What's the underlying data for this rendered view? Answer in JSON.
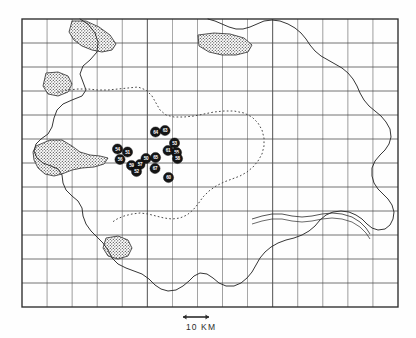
{
  "figure": {
    "type": "archaeological-distribution-map",
    "background_color": "#fefefe",
    "ink_color": "#2b2b2b"
  },
  "frame": {
    "left": 22,
    "top": 19,
    "right": 398,
    "bottom": 307,
    "grid_columns": 15,
    "grid_rows": 12,
    "cell_width": 25.07,
    "cell_height": 24.0,
    "grid_color": "#4a4a4a",
    "border_color": "#2b2b2b"
  },
  "scale_bar": {
    "label": "10 KM",
    "length_px": 26,
    "x": 196,
    "y": 317,
    "label_x": 186,
    "label_y": 322,
    "arrow_style": "double-headed"
  },
  "legend_features": {
    "coastline": "solid irregular outline",
    "internal_boundary": "dotted line",
    "stippled_area": "cross-hatched / stippled polygon",
    "river": "thin double line"
  },
  "markers": {
    "shape": "filled-circle",
    "fill_color": "#151515",
    "text_color": "#ffffff",
    "radius": 5.1,
    "count": 16,
    "items": [
      {
        "id": "site-64",
        "label": "64",
        "x": 155.5,
        "y": 132.0
      },
      {
        "id": "site-63",
        "label": "63",
        "x": 165.0,
        "y": 130.5
      },
      {
        "id": "site-53",
        "label": "53",
        "x": 174.5,
        "y": 143.0
      },
      {
        "id": "site-55",
        "label": "55",
        "x": 176.5,
        "y": 152.5
      },
      {
        "id": "site-61",
        "label": "61",
        "x": 168.0,
        "y": 150.5
      },
      {
        "id": "site-58",
        "label": "58",
        "x": 177.5,
        "y": 158.5
      },
      {
        "id": "site-54",
        "label": "54",
        "x": 117.5,
        "y": 149.0
      },
      {
        "id": "site-51",
        "label": "51",
        "x": 127.5,
        "y": 152.0
      },
      {
        "id": "site-56",
        "label": "56",
        "x": 120.0,
        "y": 159.5
      },
      {
        "id": "site-50",
        "label": "50",
        "x": 146.0,
        "y": 158.5
      },
      {
        "id": "site-65",
        "label": "65",
        "x": 155.5,
        "y": 157.5
      },
      {
        "id": "site-59",
        "label": "59",
        "x": 131.5,
        "y": 165.5
      },
      {
        "id": "site-57",
        "label": "57",
        "x": 140.0,
        "y": 164.5
      },
      {
        "id": "site-52",
        "label": "52",
        "x": 136.5,
        "y": 171.5
      },
      {
        "id": "site-67",
        "label": "67",
        "x": 155.0,
        "y": 168.5
      },
      {
        "id": "site-60",
        "label": "60",
        "x": 168.5,
        "y": 177.5
      }
    ]
  },
  "coastline": {
    "name": "island-coastline",
    "path": "M 80,19 L 88,24 L 95,33 L 98,42 L 97,52 L 90,60 L 83,66 L 80,74 L 83,82 L 86,90 L 82,96 L 72,100 L 63,104 L 57,110 L 54,118 L 52,127 L 48,134 L 41,139 L 36,144 L 34,151 L 37,158 L 43,163 L 51,166 L 58,169 L 62,175 L 63,183 L 66,190 L 72,196 L 78,201 L 82,208 L 83,216 L 86,224 L 91,231 L 97,237 L 103,243 L 108,250 L 112,258 L 118,264 L 126,268 L 134,271 L 142,274 L 149,279 L 155,285 L 161,289 L 168,291 L 176,290 L 183,286 L 189,281 L 194,276 L 200,273 L 207,274 L 213,278 L 219,283 L 226,286 L 234,286 L 241,283 L 247,278 L 252,272 L 256,265 L 260,258 L 265,252 L 271,247 L 278,243 L 286,240 L 294,238 L 302,235 L 309,231 L 315,226 L 320,220 L 326,215 L 333,212 L 341,211 L 349,212 L 356,215 L 362,219 L 367,224 L 372,228 L 378,230 L 385,229 L 390,225 L 393,219 L 394,212 L 392,205 L 388,199 L 383,194 L 378,189 L 374,183 L 372,176 L 372,168 L 375,161 L 380,155 L 385,150 L 389,144 L 391,137 L 390,129 L 386,122 L 381,116 L 375,111 L 369,106 L 364,100 L 360,93 L 357,86 L 353,79 L 348,73 L 342,68 L 335,64 L 328,60 L 321,56 L 315,51 L 310,45 L 306,39 L 301,33 L 295,28 L 288,24 L 280,21 L 272,20 L 264,21 L 257,24 L 250,27 L 243,29 L 236,29 L 229,27 L 222,24 L 215,21 L 208,19"
  },
  "internal_boundary": {
    "name": "dotted-inner-boundary",
    "style": "dotted",
    "path": "M 58,92 L 68,90 L 78,89 L 88,89 L 98,90 L 108,90 L 118,89 L 128,88 L 138,87 L 146,90 L 152,96 L 156,103 L 160,110 L 166,115 L 174,117 L 184,117 L 194,116 L 204,114 L 214,112 L 224,111 L 234,111 L 244,113 L 252,117 L 258,123 L 262,130 L 264,138 L 264,146 L 262,154 L 258,161 L 253,167 L 247,172 L 240,176 L 232,179 L 224,182 L 216,186 L 209,191 L 203,197 L 198,204 L 193,210 L 187,215 L 180,218 L 172,219 L 164,218 L 156,216 L 148,214 L 140,213 L 132,214 L 124,216 L 117,219 L 111,223"
  },
  "stipple_regions": [
    {
      "name": "stipple-north-west",
      "path": "M 72,21 L 86,21 L 99,27 L 110,35 L 116,44 L 112,50 L 102,52 L 92,50 L 82,46 L 74,40 L 69,32 Z"
    },
    {
      "name": "stipple-north-east",
      "path": "M 198,35 L 214,33 L 230,34 L 244,38 L 252,45 L 248,52 L 236,55 L 222,55 L 209,52 L 199,46 Z"
    },
    {
      "name": "stipple-west-small",
      "path": "M 46,73 L 58,72 L 68,76 L 72,84 L 68,92 L 58,96 L 48,94 L 43,86 Z"
    },
    {
      "name": "stipple-west-large",
      "path": "M 36,146 L 50,140 L 62,140 L 72,146 L 80,152 L 90,155 L 100,156 L 108,158 L 104,164 L 94,167 L 82,168 L 72,170 L 62,174 L 54,176 L 45,174 L 38,168 L 34,160 L 33,152 Z"
    },
    {
      "name": "stipple-south",
      "path": "M 106,238 L 118,236 L 128,240 L 132,248 L 128,256 L 118,259 L 108,256 L 103,248 Z"
    }
  ],
  "river": {
    "name": "river-channel",
    "path": "M 252,219 L 262,216 L 272,214 L 282,214 L 292,216 L 302,217 L 312,216 L 322,214 L 332,213 L 342,214 L 352,217 L 360,222 L 366,228 L 370,234"
  }
}
